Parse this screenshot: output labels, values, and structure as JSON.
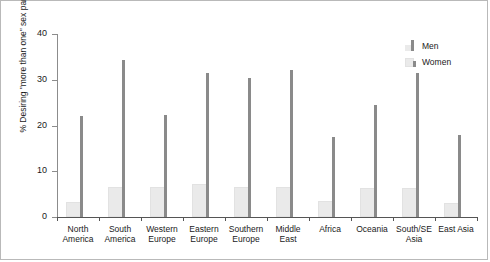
{
  "chart_data": {
    "type": "bar",
    "title": "",
    "xlabel": "",
    "ylabel": "% Desiring \"more than one\" sex partner",
    "ylim": [
      0,
      40
    ],
    "yticks": [
      0,
      10,
      20,
      30,
      40
    ],
    "ytick_labels": [
      "0",
      "10",
      "20",
      "30",
      "40"
    ],
    "grid": false,
    "legend_position": "top-right",
    "categories": [
      "North\nAmerica",
      "South\nAmerica",
      "Western\nEurope",
      "Eastern\nEurope",
      "Southern\nEurope",
      "Middle\nEast",
      "Africa",
      "Oceania",
      "South/SE\nAsia",
      "East Asia"
    ],
    "series": [
      {
        "name": "Men",
        "color": "#8a8a8a",
        "values": [
          22.1,
          34.3,
          22.2,
          31.4,
          30.4,
          32.1,
          17.4,
          24.4,
          31.4,
          17.9
        ]
      },
      {
        "name": "Women",
        "color": "#eaeaea",
        "values": [
          3.3,
          6.5,
          6.6,
          7.2,
          6.5,
          6.6,
          3.6,
          6.4,
          6.4,
          3.1
        ]
      }
    ]
  },
  "legend": {
    "items": [
      {
        "label": "Men"
      },
      {
        "label": "Women"
      }
    ]
  },
  "colors": {
    "men": "#8a8a8a",
    "women": "#eaeaea",
    "axis": "#555555",
    "text": "#1a1a1a",
    "frame": "#b9b9b9",
    "background": "#ffffff"
  }
}
